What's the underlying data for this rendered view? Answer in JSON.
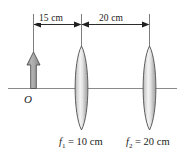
{
  "figure": {
    "background_color": "#ffffff",
    "line_color": "#6f6f6f",
    "text_color": "#1a1a1a",
    "lens_fill_light": "#f2f2f2",
    "lens_fill_dark": "#a8a8a8",
    "arrow_fill": "#9a9a9a",
    "arrow_stroke": "#4a4a4a"
  },
  "dimensions": [
    {
      "id": "d1",
      "label": "15 cm",
      "value": 15,
      "unit": "cm",
      "from": "object",
      "to": "lens1"
    },
    {
      "id": "d2",
      "label": "20 cm",
      "value": 20,
      "unit": "cm",
      "from": "lens1",
      "to": "lens2"
    }
  ],
  "object": {
    "label": "O",
    "name": "object-arrow"
  },
  "lenses": [
    {
      "id": "lens1",
      "type": "converging",
      "focal_symbol": "f",
      "focal_subscript": "1",
      "equals": "=",
      "focal_value": "10 cm",
      "label": "f1 = 10 cm"
    },
    {
      "id": "lens2",
      "type": "converging",
      "focal_symbol": "f",
      "focal_subscript": "2",
      "equals": "=",
      "focal_value": "20 cm",
      "label": "f2 = 20 cm"
    }
  ],
  "axis": {
    "name": "optical-axis"
  }
}
